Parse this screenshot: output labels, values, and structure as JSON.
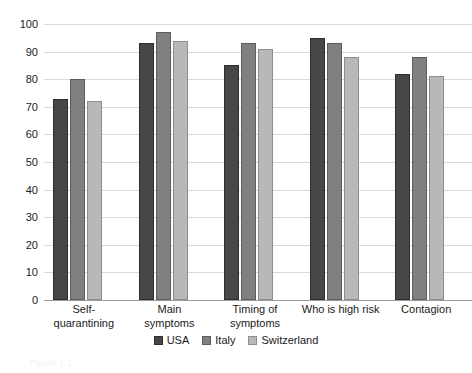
{
  "chart_data": {
    "type": "bar",
    "title": "",
    "xlabel": "",
    "ylabel": "",
    "ylim": [
      0,
      100
    ],
    "ytick_step": 10,
    "yticks": [
      0,
      10,
      20,
      30,
      40,
      50,
      60,
      70,
      80,
      90,
      100
    ],
    "grid": true,
    "legend_position": "bottom-center",
    "categories": [
      "Self-quarantining",
      "Main symptoms",
      "Timing of symptoms",
      "Who is high risk",
      "Contagion"
    ],
    "category_lines": [
      [
        "Self-quarantining"
      ],
      [
        "Main",
        "symptoms"
      ],
      [
        "Timing of",
        "symptoms"
      ],
      [
        "Who is high risk"
      ],
      [
        "Contagion"
      ]
    ],
    "series": [
      {
        "name": "USA",
        "color": "#474747",
        "values": [
          73,
          93,
          85,
          95,
          82
        ]
      },
      {
        "name": "Italy",
        "color": "#808080",
        "values": [
          80,
          97,
          93,
          93,
          88
        ]
      },
      {
        "name": "Switzerland",
        "color": "#b8b8b8",
        "values": [
          72,
          94,
          91,
          88,
          81
        ]
      }
    ]
  },
  "caption": "Figure 1.1"
}
